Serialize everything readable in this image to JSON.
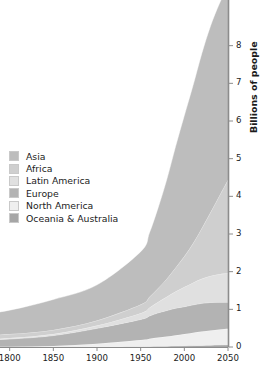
{
  "chart_data": {
    "type": "area",
    "title": "",
    "subtitle": "",
    "xlabel": "",
    "ylabel": "Billions of people",
    "xlim": [
      1750,
      2050
    ],
    "ylim": [
      0,
      9
    ],
    "xticks": [
      1800,
      1850,
      1900,
      1950,
      2000,
      2050
    ],
    "xtick_labels": [
      "1800",
      "1850",
      "1900",
      "1950",
      "2000",
      "2050"
    ],
    "yticks": [
      0,
      1,
      2,
      3,
      4,
      5,
      6,
      7,
      8
    ],
    "ytick_labels": [
      "0",
      "1",
      "2",
      "3",
      "4",
      "5",
      "6",
      "7",
      "8"
    ],
    "y_axis_position": "right",
    "x_axis_position": "bottom",
    "grid": false,
    "stacked": true,
    "stack_order": "bottom-to-top",
    "legend_position": "left-middle",
    "x": [
      1750,
      1800,
      1850,
      1900,
      1950,
      1960,
      1970,
      1980,
      1990,
      2000,
      2010,
      2020,
      2030,
      2040,
      2050
    ],
    "series": [
      {
        "name": "Oceania & Australia",
        "color": "#a6a6a6",
        "values": [
          0.002,
          0.002,
          0.002,
          0.006,
          0.013,
          0.016,
          0.02,
          0.023,
          0.027,
          0.031,
          0.037,
          0.043,
          0.048,
          0.053,
          0.057
        ]
      },
      {
        "name": "North America",
        "color": "#efefef",
        "values": [
          0.002,
          0.007,
          0.026,
          0.082,
          0.172,
          0.204,
          0.231,
          0.254,
          0.283,
          0.313,
          0.344,
          0.369,
          0.393,
          0.411,
          0.425
        ]
      },
      {
        "name": "Europe",
        "color": "#b3b3b3",
        "values": [
          0.163,
          0.203,
          0.276,
          0.408,
          0.547,
          0.604,
          0.656,
          0.693,
          0.721,
          0.727,
          0.738,
          0.748,
          0.741,
          0.723,
          0.707
        ]
      },
      {
        "name": "Latin America",
        "color": "#e0e0e0",
        "values": [
          0.016,
          0.024,
          0.038,
          0.074,
          0.167,
          0.22,
          0.288,
          0.364,
          0.443,
          0.521,
          0.59,
          0.652,
          0.706,
          0.746,
          0.768
        ]
      },
      {
        "name": "Africa",
        "color": "#cfcfcf",
        "values": [
          0.106,
          0.107,
          0.111,
          0.133,
          0.228,
          0.285,
          0.366,
          0.481,
          0.632,
          0.814,
          1.044,
          1.341,
          1.688,
          2.077,
          2.478
        ]
      },
      {
        "name": "Asia",
        "color": "#bdbdbd",
        "values": [
          0.502,
          0.635,
          0.809,
          0.947,
          1.404,
          1.7,
          2.138,
          2.642,
          3.221,
          3.741,
          4.194,
          4.641,
          4.947,
          5.098,
          5.142
        ]
      }
    ],
    "totals": [
      0.791,
      0.978,
      1.262,
      1.65,
      2.531,
      3.029,
      3.699,
      4.457,
      5.327,
      6.147,
      6.947,
      7.794,
      8.523,
      9.108,
      9.577
    ]
  },
  "legend": {
    "items": [
      {
        "label": "Asia",
        "swatch": "#bdbdbd"
      },
      {
        "label": "Africa",
        "swatch": "#cfcfcf"
      },
      {
        "label": "Latin America",
        "swatch": "#e0e0e0"
      },
      {
        "label": "Europe",
        "swatch": "#b3b3b3"
      },
      {
        "label": "North America",
        "swatch": "#efefef"
      },
      {
        "label": "Oceania & Australia",
        "swatch": "#a6a6a6"
      }
    ]
  },
  "axes": {
    "y_title": "Billions of people",
    "axis_color": "#8c8c8c",
    "tick_color": "#8c8c8c",
    "text_color": "#1b1b1b"
  }
}
